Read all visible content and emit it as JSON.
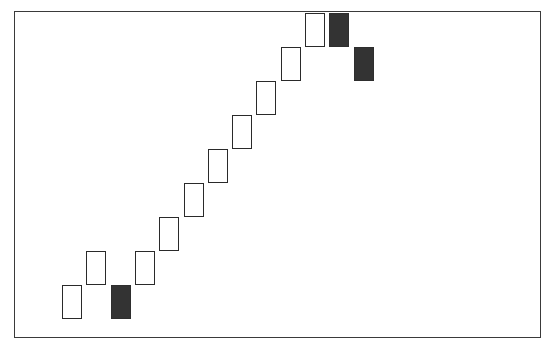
{
  "chart_data": {
    "type": "renko",
    "title": "",
    "xlabel": "",
    "ylabel": "",
    "grid": false,
    "legend": null,
    "brick_size_units": 1,
    "colors": {
      "up_fill": "#ffffff",
      "down_fill": "#333333",
      "outline": "#2a2a2a",
      "frame": "#3a3a3a"
    },
    "ylim": [
      0,
      9
    ],
    "bricks": [
      {
        "index": 0,
        "direction": "up",
        "open": 0,
        "close": 1
      },
      {
        "index": 1,
        "direction": "up",
        "open": 1,
        "close": 2
      },
      {
        "index": 2,
        "direction": "down",
        "open": 1,
        "close": 0
      },
      {
        "index": 3,
        "direction": "up",
        "open": 1,
        "close": 2
      },
      {
        "index": 4,
        "direction": "up",
        "open": 2,
        "close": 3
      },
      {
        "index": 5,
        "direction": "up",
        "open": 3,
        "close": 4
      },
      {
        "index": 6,
        "direction": "up",
        "open": 4,
        "close": 5
      },
      {
        "index": 7,
        "direction": "up",
        "open": 5,
        "close": 6
      },
      {
        "index": 8,
        "direction": "up",
        "open": 6,
        "close": 7
      },
      {
        "index": 9,
        "direction": "up",
        "open": 7,
        "close": 8
      },
      {
        "index": 10,
        "direction": "up",
        "open": 8,
        "close": 9
      },
      {
        "index": 11,
        "direction": "down",
        "open": 9,
        "close": 8
      },
      {
        "index": 12,
        "direction": "down",
        "open": 8,
        "close": 7
      }
    ]
  },
  "layout": {
    "first_brick_left": 62,
    "column_step": 24.3,
    "brick_width": 20,
    "brick_height": 34,
    "baseline_y": 319
  }
}
